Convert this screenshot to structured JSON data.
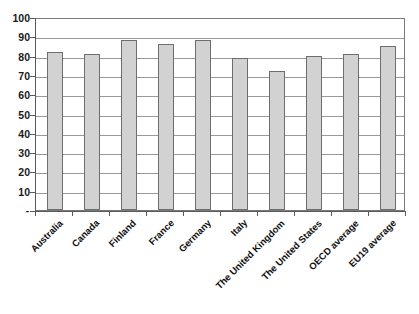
{
  "chart_data": {
    "type": "bar",
    "title": "",
    "subtitle": "",
    "xlabel": "",
    "ylabel": "",
    "categories": [
      "Australia",
      "Canada",
      "Finland",
      "France",
      "Germany",
      "Italy",
      "The United Kingdom",
      "The United States",
      "OECD average",
      "EU19 average"
    ],
    "values": [
      82,
      81,
      88,
      86,
      88,
      79,
      72,
      80,
      81,
      85
    ],
    "ylim": [
      0,
      100
    ],
    "ytick_labels": [
      "-",
      "10",
      "20",
      "30",
      "40",
      "50",
      "60",
      "70",
      "80",
      "90",
      "100"
    ],
    "ytick_values": [
      0,
      10,
      20,
      30,
      40,
      50,
      60,
      70,
      80,
      90,
      100
    ],
    "grid": true,
    "legend": "none",
    "bar_fill_color": "#d2d2d2",
    "bar_border_color": "#6e6e6e",
    "gridline_color": "#9a9a9a",
    "axis_color": "#5a5a5a",
    "plot_background_color": "#ffffff"
  }
}
